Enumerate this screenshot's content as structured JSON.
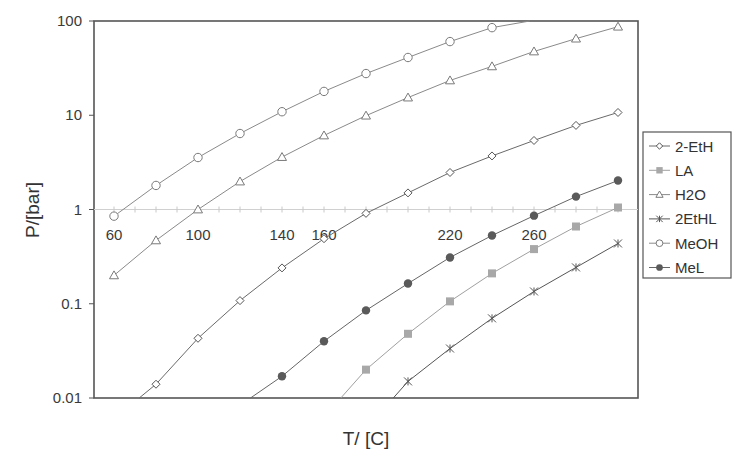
{
  "chart_data": {
    "type": "line",
    "title": "",
    "xlabel": "T/ [C]",
    "ylabel": "P/[bar]",
    "y_scale": "log",
    "ylim": [
      0.01,
      100
    ],
    "xlim": [
      50,
      310
    ],
    "y_ticks": [
      {
        "value": 100,
        "label": "100"
      },
      {
        "value": 10,
        "label": "10"
      },
      {
        "value": 1,
        "label": "1"
      },
      {
        "value": 0.1,
        "label": "0.1"
      },
      {
        "value": 0.01,
        "label": "0.01"
      }
    ],
    "x_tick_labels": [
      {
        "value": 60,
        "label": "60"
      },
      {
        "value": 100,
        "label": "100"
      },
      {
        "value": 140,
        "label": "140"
      },
      {
        "value": 160,
        "label": "160"
      },
      {
        "value": 220,
        "label": "220"
      },
      {
        "value": 260,
        "label": "260"
      }
    ],
    "x_axis_at_y": 1,
    "grid": false,
    "legend_position": "right",
    "series": [
      {
        "name": "2-EtH",
        "marker": "diamond",
        "color": "#555555",
        "fill": "#ffffff",
        "line_color": "#6a6a6a",
        "x": [
          80,
          100,
          120,
          140,
          160,
          180,
          200,
          220,
          240,
          260,
          280,
          300
        ],
        "values": [
          0.014,
          0.043,
          0.108,
          0.24,
          0.49,
          0.91,
          1.5,
          2.47,
          3.7,
          5.4,
          7.8,
          10.7
        ],
        "line_extends_to": {
          "x": 72,
          "y": 0.01
        }
      },
      {
        "name": "LA",
        "marker": "square",
        "color": "#a8a8a8",
        "fill": "#a8a8a8",
        "line_color": "#a0a0a0",
        "x": [
          180,
          200,
          220,
          240,
          260,
          280,
          300
        ],
        "values": [
          0.02,
          0.048,
          0.106,
          0.21,
          0.38,
          0.66,
          1.05
        ],
        "line_extends_to": {
          "x": 168,
          "y": 0.01
        }
      },
      {
        "name": "H2O",
        "marker": "triangle",
        "color": "#7a7a7a",
        "fill": "#ffffff",
        "line_color": "#8a8a8a",
        "x": [
          60,
          80,
          100,
          120,
          140,
          160,
          180,
          200,
          220,
          240,
          260,
          280,
          300
        ],
        "values": [
          0.2,
          0.47,
          1.0,
          1.98,
          3.6,
          6.1,
          9.9,
          15.4,
          23.4,
          33,
          47.5,
          65,
          87
        ]
      },
      {
        "name": "2EtHL",
        "marker": "asterisk",
        "color": "#555555",
        "fill": "none",
        "line_color": "#555555",
        "x": [
          200,
          220,
          240,
          260,
          280,
          300
        ],
        "values": [
          0.015,
          0.0335,
          0.07,
          0.135,
          0.243,
          0.436
        ],
        "line_extends_to": {
          "x": 193,
          "y": 0.01
        }
      },
      {
        "name": "MeOH",
        "marker": "circle-open",
        "color": "#7a7a7a",
        "fill": "#ffffff",
        "line_color": "#8a8a8a",
        "x": [
          60,
          80,
          100,
          120,
          140,
          160,
          180,
          200,
          220,
          240
        ],
        "values": [
          0.85,
          1.8,
          3.56,
          6.4,
          10.9,
          17.9,
          27.7,
          41,
          60.5,
          85
        ],
        "line_extends_to": {
          "x": 258,
          "y": 100
        }
      },
      {
        "name": "MeL",
        "marker": "circle-filled",
        "color": "#5a5a5a",
        "fill": "#5a5a5a",
        "line_color": "#666666",
        "x": [
          140,
          160,
          180,
          200,
          220,
          240,
          260,
          280,
          300
        ],
        "values": [
          0.017,
          0.04,
          0.085,
          0.164,
          0.31,
          0.53,
          0.86,
          1.37,
          2.03
        ],
        "line_extends_to": {
          "x": 125,
          "y": 0.01
        }
      }
    ]
  }
}
